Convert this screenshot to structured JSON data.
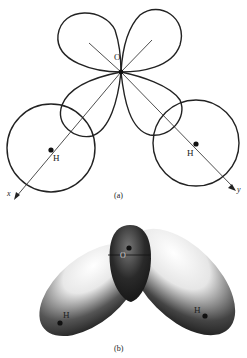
{
  "figure": {
    "panel_a": {
      "caption": "(a)",
      "labels": {
        "oxygen": "O",
        "hydrogen_left": "H",
        "hydrogen_right": "H",
        "axis_x": "x",
        "axis_y": "y"
      }
    },
    "panel_b": {
      "caption": "(b)",
      "labels": {
        "oxygen": "O",
        "hydrogen_left": "H",
        "hydrogen_right": "H"
      }
    },
    "colors": {
      "line": "#222222",
      "background": "#ffffff",
      "shade_dark": "#1a1a1a",
      "shade_light": "#f4f4f4"
    }
  }
}
